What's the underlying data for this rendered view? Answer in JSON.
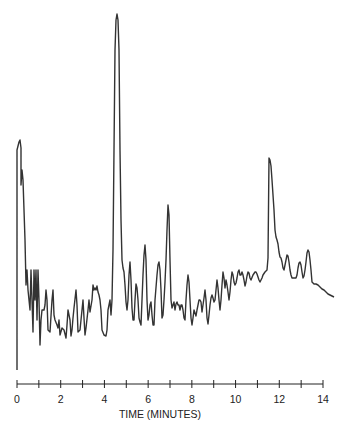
{
  "chart_data": {
    "type": "line",
    "title": "",
    "xlabel": "TIME (MINUTES)",
    "ylabel": "",
    "xlim": [
      0,
      14
    ],
    "grid": false,
    "legend": null,
    "x_tick_labels": [
      "0",
      "2",
      "4",
      "6",
      "8",
      "10",
      "12",
      "14"
    ],
    "x_tick_values": [
      0,
      2,
      4,
      6,
      8,
      10,
      12,
      14
    ],
    "minor_ticks_every": 1,
    "series": [
      {
        "name": "chromatogram",
        "color": "#333333",
        "points_px": [
          [
            17,
            370
          ],
          [
            17,
            150
          ],
          [
            19,
            142
          ],
          [
            20,
            140
          ],
          [
            21,
            148
          ],
          [
            21,
            185
          ],
          [
            22,
            170
          ],
          [
            23,
            180
          ],
          [
            25,
            240
          ],
          [
            26,
            285
          ],
          [
            27,
            270
          ],
          [
            28,
            290
          ],
          [
            30,
            310
          ],
          [
            31,
            270
          ],
          [
            32,
            300
          ],
          [
            33,
            332
          ],
          [
            34,
            270
          ],
          [
            35,
            300
          ],
          [
            36,
            270
          ],
          [
            37,
            320
          ],
          [
            38,
            270
          ],
          [
            39,
            300
          ],
          [
            40,
            345
          ],
          [
            41,
            320
          ],
          [
            42,
            310
          ],
          [
            44,
            310
          ],
          [
            45,
            305
          ],
          [
            46,
            290
          ],
          [
            47,
            300
          ],
          [
            48,
            330
          ],
          [
            50,
            332
          ],
          [
            52,
            300
          ],
          [
            53,
            290
          ],
          [
            54,
            315
          ],
          [
            55,
            320
          ],
          [
            57,
            325
          ],
          [
            58,
            328
          ],
          [
            59,
            320
          ],
          [
            60,
            335
          ],
          [
            62,
            328
          ],
          [
            64,
            330
          ],
          [
            66,
            338
          ],
          [
            67,
            325
          ],
          [
            68,
            310
          ],
          [
            70,
            320
          ],
          [
            71,
            336
          ],
          [
            72,
            330
          ],
          [
            73,
            318
          ],
          [
            74,
            308
          ],
          [
            76,
            290
          ],
          [
            77,
            305
          ],
          [
            78,
            332
          ],
          [
            80,
            330
          ],
          [
            82,
            310
          ],
          [
            83,
            300
          ],
          [
            84,
            318
          ],
          [
            85,
            335
          ],
          [
            86,
            328
          ],
          [
            88,
            310
          ],
          [
            89,
            300
          ],
          [
            90,
            312
          ],
          [
            92,
            300
          ],
          [
            93,
            285
          ],
          [
            94,
            290
          ],
          [
            95,
            288
          ],
          [
            96,
            290
          ],
          [
            97,
            286
          ],
          [
            98,
            292
          ],
          [
            99,
            295
          ],
          [
            100,
            300
          ],
          [
            101,
            310
          ],
          [
            102,
            330
          ],
          [
            104,
            335
          ],
          [
            106,
            336
          ],
          [
            107,
            330
          ],
          [
            108,
            310
          ],
          [
            110,
            300
          ],
          [
            111,
            315
          ],
          [
            112,
            300
          ],
          [
            113,
            250
          ],
          [
            115,
            50
          ],
          [
            116,
            20
          ],
          [
            117,
            14
          ],
          [
            118,
            20
          ],
          [
            119,
            50
          ],
          [
            120,
            150
          ],
          [
            121,
            220
          ],
          [
            122,
            260
          ],
          [
            123,
            268
          ],
          [
            124,
            272
          ],
          [
            125,
            285
          ],
          [
            126,
            302
          ],
          [
            127,
            310
          ],
          [
            128,
            300
          ],
          [
            129,
            275
          ],
          [
            130,
            262
          ],
          [
            131,
            280
          ],
          [
            132,
            308
          ],
          [
            133,
            320
          ],
          [
            134,
            320
          ],
          [
            135,
            300
          ],
          [
            136,
            284
          ],
          [
            137,
            288
          ],
          [
            138,
            300
          ],
          [
            139,
            318
          ],
          [
            140,
            322
          ],
          [
            141,
            325
          ],
          [
            142,
            300
          ],
          [
            143,
            275
          ],
          [
            144,
            255
          ],
          [
            145,
            245
          ],
          [
            146,
            260
          ],
          [
            147,
            300
          ],
          [
            148,
            320
          ],
          [
            149,
            315
          ],
          [
            150,
            305
          ],
          [
            151,
            302
          ],
          [
            152,
            315
          ],
          [
            153,
            325
          ],
          [
            154,
            325
          ],
          [
            155,
            300
          ],
          [
            157,
            275
          ],
          [
            158,
            265
          ],
          [
            159,
            262
          ],
          [
            160,
            270
          ],
          [
            161,
            290
          ],
          [
            162,
            318
          ],
          [
            163,
            315
          ],
          [
            164,
            300
          ],
          [
            165,
            282
          ],
          [
            166,
            260
          ],
          [
            167,
            230
          ],
          [
            168,
            205
          ],
          [
            169,
            215
          ],
          [
            170,
            260
          ],
          [
            171,
            300
          ],
          [
            172,
            308
          ],
          [
            173,
            305
          ],
          [
            174,
            302
          ],
          [
            175,
            310
          ],
          [
            176,
            304
          ],
          [
            177,
            302
          ],
          [
            178,
            305
          ],
          [
            179,
            305
          ],
          [
            180,
            310
          ],
          [
            181,
            305
          ],
          [
            182,
            305
          ],
          [
            183,
            310
          ],
          [
            184,
            318
          ],
          [
            185,
            320
          ],
          [
            186,
            300
          ],
          [
            187,
            285
          ],
          [
            188,
            275
          ],
          [
            189,
            282
          ],
          [
            190,
            300
          ],
          [
            191,
            318
          ],
          [
            192,
            325
          ],
          [
            193,
            318
          ],
          [
            194,
            310
          ],
          [
            196,
            316
          ],
          [
            197,
            310
          ],
          [
            198,
            305
          ],
          [
            199,
            300
          ],
          [
            200,
            300
          ],
          [
            201,
            302
          ],
          [
            202,
            312
          ],
          [
            203,
            305
          ],
          [
            204,
            298
          ],
          [
            205,
            290
          ],
          [
            206,
            300
          ],
          [
            207,
            318
          ],
          [
            208,
            324
          ],
          [
            209,
            315
          ],
          [
            210,
            305
          ],
          [
            211,
            298
          ],
          [
            212,
            295
          ],
          [
            213,
            298
          ],
          [
            214,
            302
          ],
          [
            215,
            300
          ],
          [
            216,
            290
          ],
          [
            217,
            280
          ],
          [
            218,
            288
          ],
          [
            219,
            300
          ],
          [
            220,
            310
          ],
          [
            221,
            300
          ],
          [
            222,
            285
          ],
          [
            223,
            272
          ],
          [
            224,
            278
          ],
          [
            225,
            288
          ],
          [
            226,
            280
          ],
          [
            227,
            285
          ],
          [
            228,
            292
          ],
          [
            229,
            300
          ],
          [
            230,
            292
          ],
          [
            231,
            280
          ],
          [
            232,
            272
          ],
          [
            233,
            275
          ],
          [
            234,
            282
          ],
          [
            235,
            285
          ],
          [
            236,
            283
          ],
          [
            237,
            278
          ],
          [
            238,
            272
          ],
          [
            239,
            270
          ],
          [
            240,
            275
          ],
          [
            241,
            275
          ],
          [
            242,
            272
          ],
          [
            243,
            275
          ],
          [
            244,
            280
          ],
          [
            245,
            286
          ],
          [
            246,
            282
          ],
          [
            247,
            276
          ],
          [
            248,
            272
          ],
          [
            249,
            273
          ],
          [
            250,
            278
          ],
          [
            251,
            280
          ],
          [
            253,
            275
          ],
          [
            255,
            272
          ],
          [
            256,
            272
          ],
          [
            257,
            274
          ],
          [
            258,
            277
          ],
          [
            259,
            280
          ],
          [
            260,
            282
          ],
          [
            262,
            278
          ],
          [
            263,
            275
          ],
          [
            265,
            272
          ],
          [
            267,
            270
          ],
          [
            268,
            258
          ],
          [
            269,
            158
          ],
          [
            270,
            160
          ],
          [
            271,
            166
          ],
          [
            272,
            180
          ],
          [
            273,
            195
          ],
          [
            274,
            210
          ],
          [
            275,
            230
          ],
          [
            276,
            237
          ],
          [
            277,
            240
          ],
          [
            278,
            244
          ],
          [
            279,
            252
          ],
          [
            280,
            257
          ],
          [
            281,
            258
          ],
          [
            282,
            262
          ],
          [
            283,
            268
          ],
          [
            284,
            270
          ],
          [
            285,
            265
          ],
          [
            286,
            260
          ],
          [
            287,
            255
          ],
          [
            288,
            256
          ],
          [
            289,
            262
          ],
          [
            290,
            270
          ],
          [
            291,
            275
          ],
          [
            292,
            278
          ],
          [
            293,
            278
          ],
          [
            294,
            278
          ],
          [
            295,
            278
          ],
          [
            296,
            278
          ],
          [
            297,
            275
          ],
          [
            298,
            268
          ],
          [
            299,
            263
          ],
          [
            300,
            262
          ],
          [
            301,
            265
          ],
          [
            302,
            272
          ],
          [
            303,
            278
          ],
          [
            304,
            276
          ],
          [
            305,
            270
          ],
          [
            306,
            262
          ],
          [
            307,
            253
          ],
          [
            308,
            250
          ],
          [
            309,
            252
          ],
          [
            310,
            260
          ],
          [
            311,
            270
          ],
          [
            312,
            282
          ],
          [
            314,
            284
          ],
          [
            316,
            284
          ],
          [
            318,
            285
          ],
          [
            320,
            287
          ],
          [
            322,
            289
          ],
          [
            324,
            290
          ],
          [
            326,
            292
          ],
          [
            328,
            294
          ],
          [
            330,
            295
          ],
          [
            332,
            296
          ],
          [
            334,
            297
          ]
        ]
      }
    ],
    "annotations": [],
    "axis": {
      "x_px_at_0": 17,
      "x_px_at_14": 323,
      "y_px": 384
    }
  }
}
